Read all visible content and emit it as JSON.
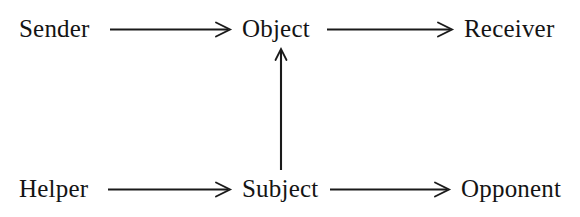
{
  "figure": {
    "kind": "actantial-model-diagram",
    "background_color": "#ffffff",
    "ink_color": "#141414",
    "width": 580,
    "height": 217
  },
  "nodes": {
    "sender": {
      "label": "Sender"
    },
    "object": {
      "label": "Object"
    },
    "receiver": {
      "label": "Receiver"
    },
    "helper": {
      "label": "Helper"
    },
    "subject": {
      "label": "Subject"
    },
    "opponent": {
      "label": "Opponent"
    }
  },
  "arrows": [
    {
      "id": "sender-to-object",
      "from": "Sender",
      "to": "Object",
      "direction": "right",
      "glyph": "→"
    },
    {
      "id": "object-to-receiver",
      "from": "Object",
      "to": "Receiver",
      "direction": "right",
      "glyph": "→"
    },
    {
      "id": "helper-to-subject",
      "from": "Helper",
      "to": "Subject",
      "direction": "right",
      "glyph": "→"
    },
    {
      "id": "subject-to-opponent",
      "from": "Subject",
      "to": "Opponent",
      "direction": "right",
      "glyph": "→"
    },
    {
      "id": "subject-to-object",
      "from": "Subject",
      "to": "Object",
      "direction": "up",
      "glyph": "↑"
    }
  ]
}
